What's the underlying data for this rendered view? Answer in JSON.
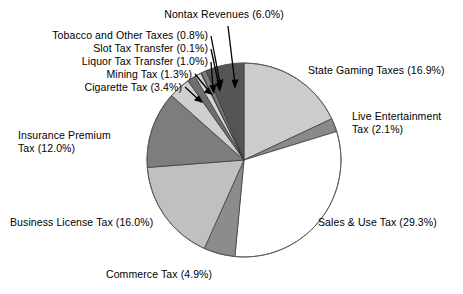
{
  "chart_data": {
    "type": "pie",
    "title": "",
    "start_angle_deg": 0,
    "direction": "clockwise",
    "legend": "none",
    "units": "percent",
    "categories": [
      "State Gaming Taxes",
      "Live Entertainment Tax",
      "Sales & Use Tax",
      "Commerce Tax",
      "Business License Tax",
      "Insurance Premium Tax",
      "Cigarette Tax",
      "Mining Tax",
      "Liquor Tax Transfer",
      "Slot Tax Transfer",
      "Tobacco and Other Taxes",
      "Nontax Revenues"
    ],
    "values": [
      16.9,
      2.1,
      29.3,
      4.9,
      16.0,
      12.0,
      3.4,
      1.3,
      1.0,
      0.1,
      0.8,
      6.0
    ],
    "colors": [
      "#cccccc",
      "#8a8a8a",
      "#ffffff",
      "#8c8c8c",
      "#c0c0c0",
      "#7d7d7d",
      "#cfcfcf",
      "#6e6e6e",
      "#d6d6d6",
      "#9a9a9a",
      "#7a7a7a",
      "#555555"
    ],
    "slice_border_color": "#333333",
    "labels": [
      "State Gaming Taxes (16.9%)",
      "Live Entertainment Tax (2.1%)",
      "Sales & Use Tax (29.3%)",
      "Commerce Tax (4.9%)",
      "Business License Tax (16.0%)",
      "Insurance Premium Tax (12.0%)",
      "Cigarette Tax (3.4%)",
      "Mining Tax (1.3%)",
      "Liquor Tax Transfer (1.0%)",
      "Slot Tax Transfer (0.1%)",
      "Tobacco and Other Taxes (0.8%)",
      "Nontax Revenues (6.0%)"
    ]
  },
  "labels": {
    "nontax": "Nontax Revenues (6.0%)",
    "tobacco": "Tobacco and Other Taxes (0.8%)",
    "slot": "Slot Tax Transfer (0.1%)",
    "liquor": "Liquor Tax Transfer (1.0%)",
    "mining": "Mining Tax (1.3%)",
    "cigarette": "Cigarette Tax (3.4%)",
    "insurance_line1": "Insurance Premium",
    "insurance_line2": "Tax (12.0%)",
    "business": "Business License Tax (16.0%)",
    "commerce": "Commerce Tax (4.9%)",
    "sales": "Sales & Use Tax (29.3%)",
    "live_line1": "Live Entertainment",
    "live_line2": "Tax (2.1%)",
    "gaming": "State Gaming Taxes (16.9%)"
  }
}
